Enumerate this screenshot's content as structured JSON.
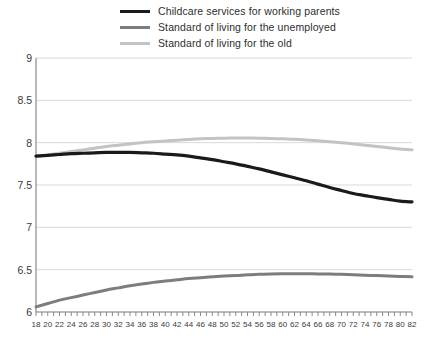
{
  "legend": {
    "position": "top",
    "items": [
      {
        "label": "Childcare services for working parents",
        "color": "#1a1a1a",
        "width": 3.2,
        "swatch_name": "legend-swatch-childcare"
      },
      {
        "label": "Standard of living for the unemployed",
        "color": "#7d7d7d",
        "width": 3.0,
        "swatch_name": "legend-swatch-unemployed"
      },
      {
        "label": "Standard of living for the old",
        "color": "#c3c3c3",
        "width": 3.0,
        "swatch_name": "legend-swatch-old"
      }
    ]
  },
  "axes": {
    "y_ticks": [
      "9",
      "8.5",
      "8",
      "7.5",
      "7",
      "6.5",
      "6"
    ],
    "x_ticks": [
      "18",
      "20",
      "22",
      "24",
      "26",
      "28",
      "30",
      "32",
      "34",
      "36",
      "38",
      "40",
      "42",
      "44",
      "46",
      "48",
      "50",
      "52",
      "54",
      "56",
      "58",
      "60",
      "62",
      "64",
      "66",
      "68",
      "70",
      "72",
      "74",
      "76",
      "78",
      "80",
      "82"
    ],
    "grid_color": "#d9d9d9",
    "axis_color": "#8a8a8a"
  },
  "chart_data": {
    "type": "line",
    "title": "",
    "subtitle": "",
    "xlabel": "",
    "ylabel": "",
    "xlim": [
      18,
      82
    ],
    "ylim": [
      6,
      9
    ],
    "grid": true,
    "legend_position": "top",
    "x": [
      18,
      20,
      22,
      24,
      26,
      28,
      30,
      32,
      34,
      36,
      38,
      40,
      42,
      44,
      46,
      48,
      50,
      52,
      54,
      56,
      58,
      60,
      62,
      64,
      66,
      68,
      70,
      72,
      74,
      76,
      78,
      80,
      82
    ],
    "series": [
      {
        "name": "Childcare services for working parents",
        "color": "#1a1a1a",
        "values": [
          7.84,
          7.85,
          7.86,
          7.87,
          7.875,
          7.88,
          7.885,
          7.885,
          7.885,
          7.88,
          7.875,
          7.865,
          7.855,
          7.84,
          7.82,
          7.8,
          7.775,
          7.75,
          7.72,
          7.69,
          7.655,
          7.62,
          7.585,
          7.55,
          7.51,
          7.47,
          7.435,
          7.4,
          7.375,
          7.35,
          7.33,
          7.31,
          7.3
        ]
      },
      {
        "name": "Standard of living for the unemployed",
        "color": "#7d7d7d",
        "values": [
          6.06,
          6.1,
          6.14,
          6.17,
          6.2,
          6.23,
          6.26,
          6.285,
          6.31,
          6.33,
          6.35,
          6.365,
          6.38,
          6.395,
          6.405,
          6.415,
          6.425,
          6.43,
          6.44,
          6.445,
          6.45,
          6.452,
          6.453,
          6.452,
          6.45,
          6.448,
          6.445,
          6.44,
          6.435,
          6.43,
          6.425,
          6.42,
          6.415
        ]
      },
      {
        "name": "Standard of living for the old",
        "color": "#c3c3c3",
        "values": [
          7.84,
          7.855,
          7.875,
          7.895,
          7.915,
          7.935,
          7.955,
          7.97,
          7.985,
          8.0,
          8.01,
          8.02,
          8.03,
          8.038,
          8.045,
          8.05,
          8.053,
          8.055,
          8.055,
          8.053,
          8.05,
          8.045,
          8.04,
          8.032,
          8.022,
          8.012,
          8.0,
          7.985,
          7.97,
          7.955,
          7.94,
          7.925,
          7.915
        ]
      }
    ]
  }
}
